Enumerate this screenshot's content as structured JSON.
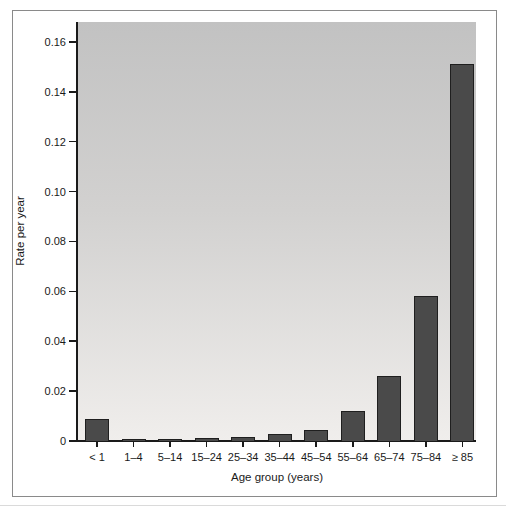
{
  "chart_data": {
    "type": "bar",
    "title": "",
    "xlabel": "Age group (years)",
    "ylabel": "Rate per year",
    "categories": [
      "< 1",
      "1–4",
      "5–14",
      "15–24",
      "25–34",
      "35–44",
      "45–54",
      "55–64",
      "65–74",
      "75–84",
      "≥ 85"
    ],
    "values": [
      0.009,
      0.001,
      0.0008,
      0.0014,
      0.0018,
      0.003,
      0.0045,
      0.012,
      0.026,
      0.058,
      0.151
    ],
    "y_ticks": [
      0,
      0.02,
      0.04,
      0.06,
      0.08,
      0.1,
      0.12,
      0.14,
      0.16
    ],
    "y_tick_labels": [
      "0",
      "0.02",
      "0.04",
      "0.06",
      "0.08",
      "0.10",
      "0.12",
      "0.14",
      "0.16"
    ],
    "ylim": [
      0,
      0.168
    ],
    "grid": false,
    "legend_position": "none",
    "bar_color": "#4a4a4a",
    "bar_border_color": "#1f1f1f",
    "plot_bg_top_color": "#c2c2c2",
    "plot_bg_bottom_color": "#f0eeec",
    "frame_color": "#8a8a8a"
  }
}
